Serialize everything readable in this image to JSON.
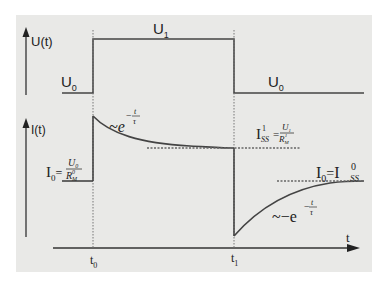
{
  "diagram": {
    "upper_plot": {
      "axis_label": "U(t)",
      "levels": [
        {
          "name": "U",
          "sub": "0",
          "position": "before t0"
        },
        {
          "name": "U",
          "sub": "1",
          "position": "between t0 and t1"
        },
        {
          "name": "U",
          "sub": "0",
          "position": "after t1"
        }
      ]
    },
    "lower_plot": {
      "axis_label": "I(t)",
      "initial_current": {
        "lhs": "I",
        "lhs_sub": "0",
        "num": "U",
        "num_sub": "0",
        "den": "R",
        "den_sub": "M",
        "den_sup": "0"
      },
      "decay_annotation": {
        "prefix": "~e",
        "exp_num": "t",
        "exp_den": "τ",
        "exp_sign": "−"
      },
      "steady_state_1": {
        "lhs": "I",
        "lhs_sub": "SS",
        "lhs_sup": "1",
        "num": "U",
        "num_sub": "1",
        "den": "R",
        "den_sub": "M",
        "den_sup": "1"
      },
      "steady_state_0": {
        "lhs": "I",
        "lhs_sub": "0",
        "eq": "=",
        "rhs": "I",
        "rhs_sub": "SS",
        "rhs_sup": "0"
      },
      "recovery_annotation": {
        "prefix": "~−e",
        "exp_num": "t",
        "exp_den": "τ",
        "exp_sign": "−"
      }
    },
    "time_axis": {
      "label": "t",
      "ticks": [
        {
          "label": "t",
          "sub": "0"
        },
        {
          "label": "t",
          "sub": "1"
        }
      ]
    },
    "colors": {
      "background": "#e9e9e7",
      "line": "#333333",
      "dashed": "#666666"
    }
  }
}
